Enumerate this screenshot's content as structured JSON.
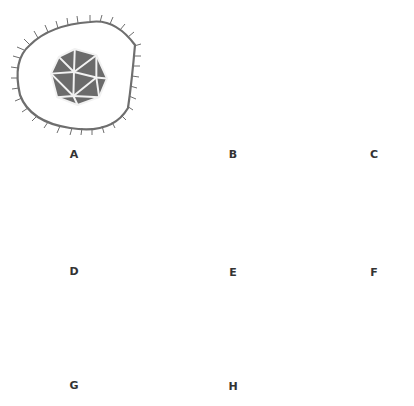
{
  "diagram": {
    "title": "",
    "colors": {
      "capsid_fill": "#6b6b6b",
      "capsid_edge": "#f2f2f2",
      "outline": "#6e6e6e",
      "label": "#333333",
      "background": "#ffffff"
    },
    "items": [
      {
        "id": "A",
        "label": "A",
        "shape": "enveloped-icosahedral-virus"
      },
      {
        "id": "B",
        "label": "B",
        "shape": "large-icosahedral-virus"
      },
      {
        "id": "C",
        "label": "C",
        "shape": "enveloped-helical-virus"
      },
      {
        "id": "D",
        "label": "D",
        "shape": "medium-icosahedral-virus"
      },
      {
        "id": "E",
        "label": "E",
        "shape": "small-icosahedral-virus"
      },
      {
        "id": "F",
        "label": "F",
        "shape": "smallest-icosahedral-virus"
      },
      {
        "id": "G",
        "label": "G",
        "shape": "bacteriophage"
      },
      {
        "id": "H",
        "label": "H",
        "shape": "rod-shaped-helical-virus"
      }
    ]
  }
}
